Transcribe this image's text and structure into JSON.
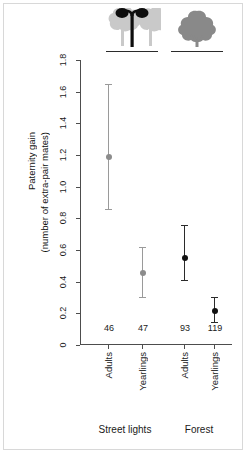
{
  "axis": {
    "y_title_line1": "Paternity gain",
    "y_title_line2": "(number of extra-pair mates)",
    "y_ticks": [
      "0",
      "0.2",
      "0.4",
      "0.6",
      "0.8",
      "1.0",
      "1.2",
      "1.4",
      "1.6",
      "1.8"
    ]
  },
  "groups": [
    {
      "label": "Street lights",
      "icon": "streetlight-tree-icon"
    },
    {
      "label": "Forest",
      "icon": "tree-icon"
    }
  ],
  "points": [
    {
      "category": "Adults",
      "group": "Street lights",
      "n": "46",
      "mean": 1.19,
      "lower": 0.86,
      "upper": 1.65,
      "color": "#8c8c8c"
    },
    {
      "category": "Yearlings",
      "group": "Street lights",
      "n": "47",
      "mean": 0.455,
      "lower": 0.305,
      "upper": 0.62,
      "color": "#8c8c8c"
    },
    {
      "category": "Adults",
      "group": "Forest",
      "n": "93",
      "mean": 0.55,
      "lower": 0.41,
      "upper": 0.755,
      "color": "#111111"
    },
    {
      "category": "Yearlings",
      "group": "Forest",
      "n": "119",
      "mean": 0.215,
      "lower": 0.145,
      "upper": 0.305,
      "color": "#111111"
    }
  ],
  "chart_data": {
    "type": "scatter",
    "title": "",
    "xlabel": "",
    "ylabel": "Paternity gain (number of extra-pair mates)",
    "ylim": [
      0,
      1.8
    ],
    "yticks": [
      0,
      0.2,
      0.4,
      0.6,
      0.8,
      1.0,
      1.2,
      1.4,
      1.6,
      1.8
    ],
    "grid": false,
    "legend": "none",
    "categories": [
      "Adults",
      "Yearlings",
      "Adults",
      "Yearlings"
    ],
    "groups": [
      "Street lights",
      "Street lights",
      "Forest",
      "Forest"
    ],
    "values": [
      1.19,
      0.455,
      0.55,
      0.215
    ],
    "error_lower": [
      0.86,
      0.305,
      0.41,
      0.145
    ],
    "error_upper": [
      1.65,
      0.62,
      0.755,
      0.305
    ],
    "sample_sizes": [
      46,
      47,
      93,
      119
    ],
    "point_colors": [
      "#8c8c8c",
      "#8c8c8c",
      "#111111",
      "#111111"
    ],
    "annotations": [
      "46",
      "47",
      "93",
      "119"
    ]
  }
}
